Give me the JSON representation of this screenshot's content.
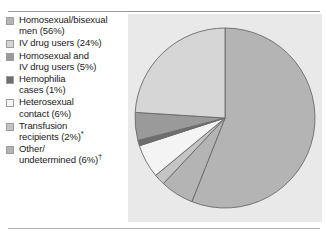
{
  "figure": {
    "title": "",
    "has_top_rule": true,
    "has_bottom_rule": true,
    "panel_color": "#e9e9e9",
    "background_color": "#ffffff"
  },
  "legend": {
    "items": [
      {
        "label": "Homosexual/bisexual\nmen (56%)",
        "marker": "legend-swatch-homosexual-bisexual-men",
        "color": "#b4b4b4",
        "footnote": ""
      },
      {
        "label": "IV drug users (24%)",
        "marker": "legend-swatch-iv-drug-users",
        "color": "#d6d6d6",
        "footnote": ""
      },
      {
        "label": "Homosexual and\nIV drug users (5%)",
        "marker": "legend-swatch-homosexual-and-iv-drug-users",
        "color": "#9a9a9a",
        "footnote": ""
      },
      {
        "label": "Hemophilia\ncases (1%)",
        "marker": "legend-swatch-hemophilia-cases",
        "color": "#6e6e6e",
        "footnote": ""
      },
      {
        "label": "Heterosexual\ncontact (6%)",
        "marker": "legend-swatch-heterosexual-contact",
        "color": "#f4f4f4",
        "footnote": ""
      },
      {
        "label": "Transfusion\nrecipients (2%)",
        "marker": "legend-swatch-transfusion-recipients",
        "color": "#c4c4c4",
        "footnote": "*"
      },
      {
        "label": "Other/\nundetermined (6%)",
        "marker": "legend-swatch-other-undetermined",
        "color": "#b4b4b4",
        "footnote": "†"
      }
    ]
  },
  "chart_data": {
    "type": "pie",
    "title": "",
    "xlabel": "",
    "ylabel": "",
    "legend_position": "left",
    "start_angle_deg": 0,
    "direction": "clockwise",
    "units": "percent",
    "total": 100,
    "categories": [
      "Homosexual/bisexual men",
      "IV drug users",
      "Homosexual and IV drug users",
      "Hemophilia cases",
      "Heterosexual contact",
      "Transfusion recipients",
      "Other/undetermined"
    ],
    "values": [
      56,
      24,
      5,
      1,
      6,
      2,
      6
    ],
    "labels": [
      "Homosexual/bisexual men (56%)",
      "IV drug users (24%)",
      "Homosexual and IV drug users (5%)",
      "Hemophilia cases (1%)",
      "Heterosexual contact (6%)",
      "Transfusion recipients (2%)*",
      "Other/undetermined (6%)†"
    ],
    "colors": [
      "#b4b4b4",
      "#d6d6d6",
      "#9a9a9a",
      "#6e6e6e",
      "#f4f4f4",
      "#c4c4c4",
      "#b4b4b4"
    ],
    "slice_order": [
      "Homosexual/bisexual men",
      "Other/undetermined",
      "Transfusion recipients",
      "Heterosexual contact",
      "Hemophilia cases",
      "Homosexual and IV drug users",
      "IV drug users"
    ],
    "slice_order_values": [
      56,
      6,
      2,
      6,
      1,
      5,
      24
    ],
    "slice_order_colors": [
      "#b4b4b4",
      "#b4b4b4",
      "#c4c4c4",
      "#f4f4f4",
      "#6e6e6e",
      "#9a9a9a",
      "#d6d6d6"
    ],
    "geometry": {
      "center_x": 97,
      "center_y": 104,
      "radius": 90,
      "stroke": "#6a6a6a",
      "stroke_width": 0.9
    },
    "footnotes": [
      "*",
      "†"
    ]
  }
}
